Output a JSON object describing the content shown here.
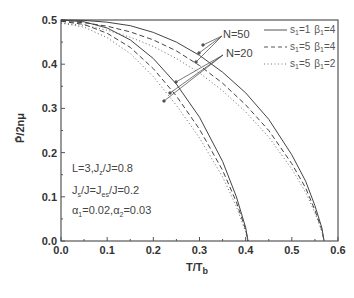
{
  "chart_data": {
    "type": "line",
    "title": "",
    "xlabel": "T/T_b",
    "ylabel": "P̄/2nμ",
    "xlim": [
      0.0,
      0.6
    ],
    "ylim": [
      0.0,
      0.5
    ],
    "x_ticks": [
      "0.0",
      "0.1",
      "0.2",
      "0.3",
      "0.4",
      "0.5",
      "0.6"
    ],
    "y_ticks": [
      "0.0",
      "0.1",
      "0.2",
      "0.3",
      "0.4",
      "0.5"
    ],
    "grid": false,
    "legend_position": "upper right",
    "legend": [
      {
        "label_s": "s",
        "s_sub": "1",
        "s_val": "=1",
        "b": "β",
        "b_sub": "1",
        "b_val": "=4",
        "style": "solid"
      },
      {
        "label_s": "s",
        "s_sub": "1",
        "s_val": "=5",
        "b": "β",
        "b_sub": "1",
        "b_val": "=4",
        "style": "dashed"
      },
      {
        "label_s": "s",
        "s_sub": "1",
        "s_val": "=5",
        "b": "β",
        "b_sub": "1",
        "b_val": "=2",
        "style": "dotted"
      }
    ],
    "annotations": {
      "n50": "N=50",
      "n20": "N=20",
      "params_line1": "L=3,J",
      "params_line1_sub": "z",
      "params_line1_rest": "/J=0.8",
      "params_line2_a": "J",
      "params_line2_a_sub": "s",
      "params_line2_b": "/J=J",
      "params_line2_b_sub": "es",
      "params_line2_c": "/J=0.2",
      "params_line3_a": "α",
      "params_line3_a_sub": "1",
      "params_line3_b": "=0.02,α",
      "params_line3_b_sub": "2",
      "params_line3_c": "=0.03"
    },
    "series": [
      {
        "name": "N=50, s1=1, β1=4",
        "style": "solid",
        "x": [
          0.0,
          0.05,
          0.1,
          0.15,
          0.2,
          0.25,
          0.3,
          0.35,
          0.4,
          0.45,
          0.5,
          0.53,
          0.55,
          0.565,
          0.57
        ],
        "y": [
          0.5,
          0.499,
          0.495,
          0.487,
          0.472,
          0.45,
          0.42,
          0.382,
          0.335,
          0.275,
          0.195,
          0.135,
          0.08,
          0.03,
          0.0
        ]
      },
      {
        "name": "N=50, s1=5, β1=4",
        "style": "dashed",
        "x": [
          0.0,
          0.05,
          0.1,
          0.15,
          0.2,
          0.25,
          0.3,
          0.35,
          0.4,
          0.45,
          0.5,
          0.53,
          0.55,
          0.565,
          0.57
        ],
        "y": [
          0.497,
          0.494,
          0.486,
          0.473,
          0.455,
          0.43,
          0.397,
          0.357,
          0.308,
          0.25,
          0.175,
          0.12,
          0.07,
          0.025,
          0.0
        ]
      },
      {
        "name": "N=50, s1=5, β1=2",
        "style": "dotted",
        "x": [
          0.0,
          0.05,
          0.1,
          0.15,
          0.2,
          0.25,
          0.3,
          0.35,
          0.4,
          0.45,
          0.5,
          0.53,
          0.55,
          0.565,
          0.57
        ],
        "y": [
          0.493,
          0.488,
          0.477,
          0.461,
          0.44,
          0.413,
          0.38,
          0.34,
          0.292,
          0.235,
          0.163,
          0.11,
          0.064,
          0.022,
          0.0
        ]
      },
      {
        "name": "N=20, s1=1, β1=4",
        "style": "solid",
        "x": [
          0.0,
          0.05,
          0.1,
          0.15,
          0.2,
          0.25,
          0.3,
          0.35,
          0.38,
          0.4,
          0.405
        ],
        "y": [
          0.5,
          0.496,
          0.482,
          0.455,
          0.413,
          0.355,
          0.28,
          0.18,
          0.1,
          0.03,
          0.0
        ]
      },
      {
        "name": "N=20, s1=5, β1=4",
        "style": "dashed",
        "x": [
          0.0,
          0.05,
          0.1,
          0.15,
          0.2,
          0.25,
          0.3,
          0.35,
          0.38,
          0.4,
          0.405
        ],
        "y": [
          0.497,
          0.49,
          0.47,
          0.438,
          0.39,
          0.328,
          0.253,
          0.16,
          0.088,
          0.025,
          0.0
        ]
      },
      {
        "name": "N=20, s1=5, β1=2",
        "style": "dotted",
        "x": [
          0.0,
          0.05,
          0.1,
          0.15,
          0.2,
          0.25,
          0.3,
          0.35,
          0.38,
          0.4,
          0.405
        ],
        "y": [
          0.493,
          0.484,
          0.46,
          0.424,
          0.372,
          0.307,
          0.233,
          0.145,
          0.078,
          0.02,
          0.0
        ]
      }
    ]
  },
  "colors": {
    "axis": "#555555",
    "line": "#444444",
    "arrow": "#555555"
  }
}
